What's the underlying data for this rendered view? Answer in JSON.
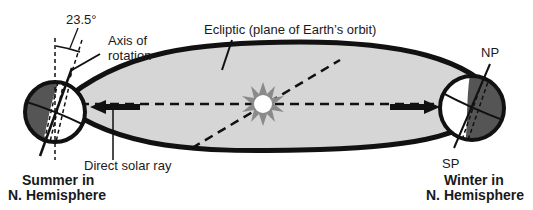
{
  "diagram": {
    "labels": {
      "tilt_angle": "23.5°",
      "axis_of_rotation_line1": "Axis of",
      "axis_of_rotation_line2": "rotation",
      "ecliptic": "Ecliptic (plane of Earth’s orbit)",
      "direct_solar_ray": "Direct solar ray",
      "north_pole": "NP",
      "south_pole": "SP",
      "summer_line1": "Summer in",
      "summer_line2": "N. Hemisphere",
      "winter_line1": "Winter in",
      "winter_line2": "N. Hemisphere"
    },
    "colors": {
      "orbit_fill": "#d6d6d6",
      "outline": "#111111",
      "night_side": "#555555",
      "sun_rays": "#8a8a8a",
      "sun_core": "#ffffff"
    }
  }
}
